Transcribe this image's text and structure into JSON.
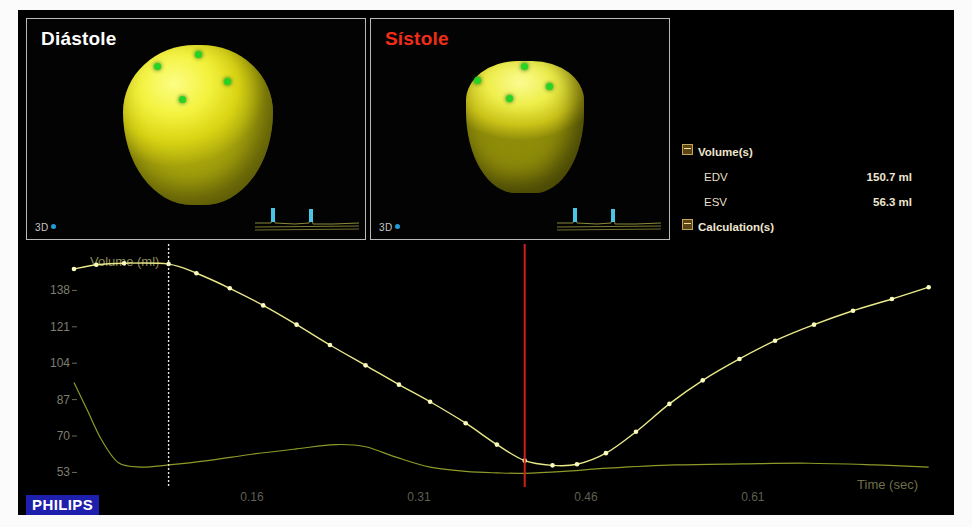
{
  "vendor": {
    "logo_text": "PHILIPS"
  },
  "viewports": [
    {
      "id": "diastole",
      "title": "Diástole",
      "title_color": "#ffffff",
      "mode_tag": "3D",
      "model": "left-ventricular-cast"
    },
    {
      "id": "systole",
      "title": "Sístole",
      "title_color": "#f12d1a",
      "mode_tag": "3D",
      "model": "left-ventricular-cast"
    }
  ],
  "measurements": {
    "groups": [
      {
        "name": "Volume(s)",
        "expanded": true,
        "rows": [
          {
            "label": "EDV",
            "value": "150.7 ml"
          },
          {
            "label": "ESV",
            "value": "56.3 ml"
          }
        ]
      },
      {
        "name": "Calculation(s)",
        "expanded": true,
        "rows": [
          {
            "label": "EF",
            "value": "62.6 %"
          },
          {
            "label": "SV",
            "value": "94.4 ml"
          }
        ]
      },
      {
        "name": "Regional",
        "expanded": true,
        "rows": [
          {
            "label": "Tmsv Sel-SD",
            "value": "**** ms"
          },
          {
            "label": "Tmsv Sel-Dif",
            "value": "**** ms"
          },
          {
            "label": "Tmsv Sel-SD",
            "value": "**** %"
          }
        ]
      }
    ]
  },
  "chart_data": {
    "type": "line",
    "title": "Volume (ml)",
    "xlabel": "Time (sec)",
    "ylabel": "Volume (ml)",
    "xlim": [
      0.0,
      0.78
    ],
    "ylim": [
      49,
      155
    ],
    "xticks": [
      "0.16",
      "0.31",
      "0.46",
      "0.61"
    ],
    "xtick_values": [
      0.16,
      0.31,
      0.46,
      0.61
    ],
    "yticks": [
      "138",
      "121",
      "104",
      "87",
      "70",
      "53"
    ],
    "ytick_values": [
      138,
      121,
      104,
      87,
      70,
      53
    ],
    "grid": false,
    "legend": "none",
    "markers": {
      "diastole_cursor": {
        "x": 0.085,
        "color": "#e8e8e8",
        "style": "dotted"
      },
      "systole_cursor": {
        "x": 0.405,
        "color": "#d21d1d",
        "style": "solid"
      }
    },
    "series": [
      {
        "name": "LV Volume",
        "color": "#e9e98a",
        "marker": "dot",
        "x": [
          0.0,
          0.02,
          0.045,
          0.085,
          0.11,
          0.14,
          0.17,
          0.2,
          0.23,
          0.262,
          0.292,
          0.32,
          0.352,
          0.38,
          0.405,
          0.43,
          0.452,
          0.478,
          0.505,
          0.535,
          0.565,
          0.598,
          0.63,
          0.665,
          0.7,
          0.735,
          0.768
        ],
        "y": [
          148.0,
          150.0,
          150.7,
          150.3,
          146.0,
          139.0,
          131.0,
          122.0,
          112.5,
          103.0,
          94.0,
          86.0,
          76.0,
          66.0,
          58.5,
          56.3,
          56.8,
          62.0,
          72.0,
          85.0,
          96.0,
          106.0,
          114.5,
          122.0,
          128.5,
          134.0,
          139.5
        ]
      },
      {
        "name": "dV/dt",
        "color": "#8e9a28",
        "marker": "none",
        "x": [
          0.0,
          0.012,
          0.025,
          0.04,
          0.06,
          0.085,
          0.12,
          0.16,
          0.2,
          0.235,
          0.262,
          0.29,
          0.32,
          0.352,
          0.38,
          0.405,
          0.44,
          0.48,
          0.54,
          0.6,
          0.66,
          0.72,
          0.768
        ],
        "y": [
          95.0,
          82.0,
          68.0,
          57.5,
          55.5,
          56.5,
          58.5,
          61.5,
          64.0,
          66.0,
          65.0,
          60.0,
          55.5,
          53.5,
          52.8,
          52.6,
          53.5,
          55.0,
          56.5,
          57.0,
          57.3,
          56.5,
          55.5
        ]
      }
    ]
  }
}
